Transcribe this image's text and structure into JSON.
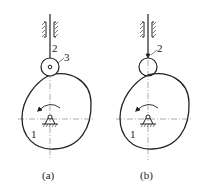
{
  "figures": [
    {
      "id": "a",
      "caption": "(a)",
      "labels": {
        "cam": "1",
        "follower": "2",
        "roller": "3"
      },
      "follower_type": "roller follower",
      "rotation": "counterclockwise"
    },
    {
      "id": "b",
      "caption": "(b)",
      "labels": {
        "cam": "1",
        "follower": "2"
      },
      "follower_type": "roller follower (roller integral with rod)",
      "rotation": "counterclockwise"
    }
  ],
  "colors": {
    "line": "#222222",
    "centerline": "#666666",
    "background": "#ffffff"
  }
}
